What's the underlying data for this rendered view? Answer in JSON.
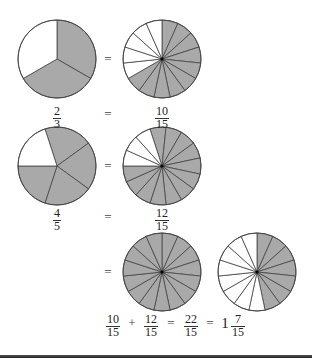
{
  "colors": {
    "shaded": "#a9a9a9",
    "unshaded": "#ffffff",
    "stroke": "#444444",
    "rule": "#2a2a2a"
  },
  "circles": [
    {
      "id": "two-thirds",
      "cx": 57,
      "cy": 59,
      "r": 39,
      "slices": 3,
      "shaded": 2,
      "start_deg": 0
    },
    {
      "id": "ten-fifteenths",
      "cx": 162,
      "cy": 59,
      "r": 39,
      "slices": 15,
      "shaded": 10,
      "start_deg": 0
    },
    {
      "id": "four-fifths",
      "cx": 57,
      "cy": 166,
      "r": 39,
      "slices": 5,
      "shaded": 4,
      "start_deg": -18
    },
    {
      "id": "twelve-fifteenths",
      "cx": 162,
      "cy": 166,
      "r": 39,
      "slices": 15,
      "shaded": 12,
      "start_deg": -18
    },
    {
      "id": "fifteen-fifteenths",
      "cx": 162,
      "cy": 272,
      "r": 39,
      "slices": 15,
      "shaded": 15,
      "start_deg": 0
    },
    {
      "id": "seven-fifteenths",
      "cx": 257,
      "cy": 272,
      "r": 39,
      "slices": 15,
      "shaded": 7,
      "start_deg": 0
    }
  ],
  "row1": {
    "left_fraction": {
      "num": "2",
      "den": "3"
    },
    "equals": "=",
    "right_fraction": {
      "num": "10",
      "den": "15"
    },
    "circle_equals": "="
  },
  "row2": {
    "left_fraction": {
      "num": "4",
      "den": "5"
    },
    "equals": "=",
    "right_fraction": {
      "num": "12",
      "den": "15"
    },
    "circle_equals": "="
  },
  "row3": {
    "circle_equals": "="
  },
  "sum_equation": {
    "term1": {
      "num": "10",
      "den": "15"
    },
    "plus": "+",
    "term2": {
      "num": "12",
      "den": "15"
    },
    "equals1": "=",
    "result": {
      "num": "22",
      "den": "15"
    },
    "equals2": "=",
    "mixed_whole": "1",
    "mixed_frac": {
      "num": "7",
      "den": "15"
    }
  }
}
